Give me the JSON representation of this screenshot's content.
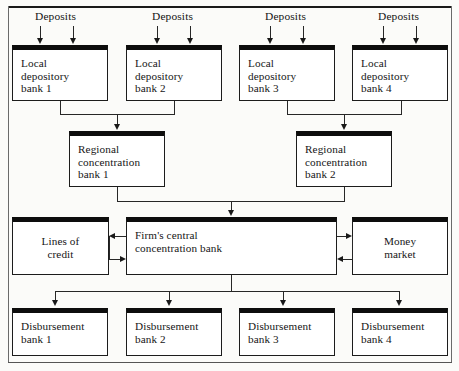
{
  "diagram": {
    "type": "flowchart",
    "deposit_labels": [
      {
        "text": "Deposits"
      },
      {
        "text": "Deposits"
      },
      {
        "text": "Deposits"
      },
      {
        "text": "Deposits"
      }
    ],
    "local_banks": [
      {
        "text": "Local\ndepository\nbank 1"
      },
      {
        "text": "Local\ndepository\nbank 2"
      },
      {
        "text": "Local\ndepository\nbank 3"
      },
      {
        "text": "Local\ndepository\nbank 4"
      }
    ],
    "regional_banks": [
      {
        "text": "Regional\nconcentration\nbank 1"
      },
      {
        "text": "Regional\nconcentration\nbank 2"
      }
    ],
    "central_bank": {
      "text": "Firm's central\nconcentration bank"
    },
    "lines_of_credit": {
      "text": "Lines of\ncredit"
    },
    "money_market": {
      "text": "Money\nmarket"
    },
    "disbursement_banks": [
      {
        "text": "Disbursement\nbank 1"
      },
      {
        "text": "Disbursement\nbank 2"
      },
      {
        "text": "Disbursement\nbank 3"
      },
      {
        "text": "Disbursement\nbank 4"
      }
    ],
    "colors": {
      "box_fill": "#ffffff",
      "box_border": "#1c1c1c",
      "box_top_band": "#0d0d0d",
      "connector": "#272727",
      "text": "#161616",
      "page_background": "#fbfbf9"
    }
  }
}
